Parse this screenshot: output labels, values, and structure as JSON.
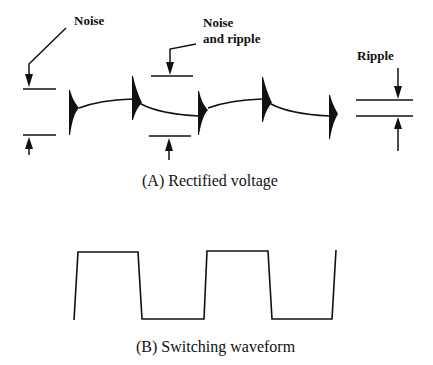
{
  "diagram": {
    "panel_a": {
      "caption": "(A)  Rectified voltage",
      "labels": {
        "noise": "Noise",
        "noise_and_ripple_line1": "Noise",
        "noise_and_ripple_line2": "and ripple",
        "ripple": "Ripple"
      }
    },
    "panel_b": {
      "caption": "(B)  Switching waveform"
    },
    "colors": {
      "ink": "#111111",
      "background": "#ffffff"
    }
  }
}
